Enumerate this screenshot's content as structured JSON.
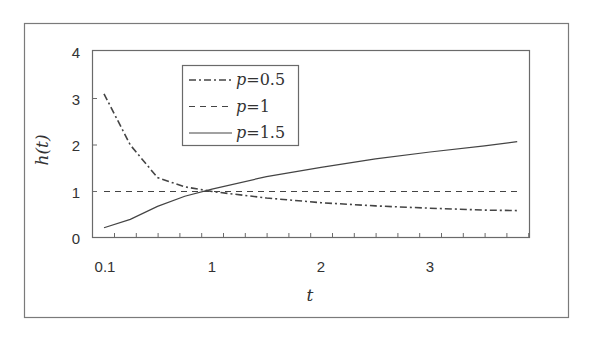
{
  "chart_data": {
    "type": "line",
    "title": "",
    "xlabel": "t",
    "ylabel": "h(t)",
    "xlim": [
      0.1,
      3.9
    ],
    "ylim": [
      0,
      4
    ],
    "x_ticks": [
      {
        "value": 0.1,
        "label": "0.1"
      },
      {
        "value": 1,
        "label": "1"
      },
      {
        "value": 2,
        "label": "2"
      },
      {
        "value": 3,
        "label": "3"
      }
    ],
    "y_ticks": [
      {
        "value": 0,
        "label": "0"
      },
      {
        "value": 1,
        "label": "1"
      },
      {
        "value": 2,
        "label": "2"
      },
      {
        "value": 3,
        "label": "3"
      },
      {
        "value": 4,
        "label": "4"
      }
    ],
    "grid": false,
    "legend_position": "upper-left-inside",
    "series": [
      {
        "name": "p=0.5",
        "var": "p",
        "value_label": "=0.5",
        "style": "dash-dot",
        "x": [
          0.1,
          0.25,
          0.5,
          0.75,
          1.0,
          1.5,
          2.0,
          2.5,
          3.0,
          3.5,
          3.8
        ],
        "y": [
          3.1,
          2.0,
          1.3,
          1.1,
          1.0,
          0.86,
          0.76,
          0.69,
          0.64,
          0.6,
          0.59
        ]
      },
      {
        "name": "p=1",
        "var": "p",
        "value_label": "=1",
        "style": "dashed",
        "x": [
          0.1,
          3.8
        ],
        "y": [
          1.0,
          1.0
        ]
      },
      {
        "name": "p=1.5",
        "var": "p",
        "value_label": "=1.5",
        "style": "solid",
        "x": [
          0.1,
          0.25,
          0.5,
          0.75,
          1.0,
          1.5,
          2.0,
          2.5,
          3.0,
          3.5,
          3.8
        ],
        "y": [
          0.22,
          0.4,
          0.68,
          0.9,
          1.05,
          1.32,
          1.52,
          1.7,
          1.85,
          1.98,
          2.07
        ]
      }
    ]
  }
}
